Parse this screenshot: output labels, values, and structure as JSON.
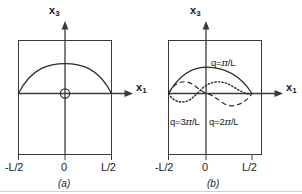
{
  "figure": {
    "panels": [
      {
        "id": "panel-a",
        "caption": "(a)",
        "axes": {
          "vertical_label_base": "x",
          "vertical_label_sub": "3",
          "horizontal_label_base": "x",
          "horizontal_label_sub": "1"
        },
        "ticks": [
          {
            "name": "tick-left",
            "label": "-L/2"
          },
          {
            "name": "tick-origin",
            "label": "0"
          },
          {
            "name": "tick-right",
            "label": "L/2"
          }
        ],
        "markers": [
          {
            "name": "origin-marker",
            "shape": "circle"
          }
        ],
        "curves": [
          {
            "name": "fundamental-curve",
            "style": "solid",
            "mode": 1
          }
        ]
      },
      {
        "id": "panel-b",
        "caption": "(b)",
        "axes": {
          "vertical_label_base": "x",
          "vertical_label_sub": "3",
          "horizontal_label_base": "x",
          "horizontal_label_sub": "1"
        },
        "ticks": [
          {
            "name": "tick-left",
            "label": "-L/2"
          },
          {
            "name": "tick-origin",
            "label": "0"
          },
          {
            "name": "tick-right",
            "label": "L/2"
          }
        ],
        "curves": [
          {
            "name": "mode-1-curve",
            "style": "solid",
            "mode": 1,
            "label_prefix": "q=",
            "label_pi": "π",
            "label_suffix": "/L",
            "label_full": "q=π/L"
          },
          {
            "name": "mode-2-curve",
            "style": "dashed",
            "mode": 2,
            "label_prefix": "q=2",
            "label_pi": "π",
            "label_suffix": "/L",
            "label_full": "q=2π/L"
          },
          {
            "name": "mode-3-curve",
            "style": "dotted",
            "mode": 3,
            "label_prefix": "q=3",
            "label_pi": "π",
            "label_suffix": "/L",
            "label_full": "q=3π/L"
          }
        ]
      }
    ],
    "colors": {
      "ink": "#2b2b2b",
      "outline": "#3a3a3a",
      "background": "#ffffff"
    }
  }
}
